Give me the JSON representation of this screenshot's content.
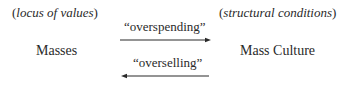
{
  "diagram": {
    "left": {
      "annotation_open": "(",
      "annotation": "locus of values",
      "annotation_close": ")",
      "node": "Masses"
    },
    "right": {
      "annotation_open": "(",
      "annotation": "structural conditions",
      "annotation_close": ")",
      "node": "Mass Culture"
    },
    "edges": [
      {
        "label": "“overspending”",
        "direction": "left-to-right"
      },
      {
        "label": "“overselling”",
        "direction": "right-to-left"
      }
    ],
    "colors": {
      "text": "#2a2a2a",
      "arrow": "#2a2a2a",
      "background": "#ffffff"
    }
  }
}
